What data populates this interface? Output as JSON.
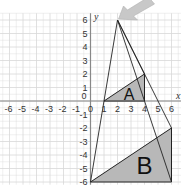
{
  "diagram": {
    "type": "coordinate-grid-enlargement",
    "axes": {
      "x_label": "x",
      "y_label": "y",
      "x_range": [
        -6,
        6
      ],
      "y_range": [
        -6,
        6
      ],
      "x_ticks": [
        "-6",
        "-5",
        "-4",
        "-3",
        "-2",
        "-1",
        "0",
        "1",
        "2",
        "3",
        "4",
        "5",
        "6"
      ],
      "y_ticks": [
        "6",
        "5",
        "4",
        "3",
        "2",
        "1",
        "0",
        "-1",
        "-2",
        "-3",
        "-4",
        "-5",
        "-6"
      ]
    },
    "shapes": [
      {
        "name": "A",
        "label": "A",
        "vertices": [
          [
            1,
            0
          ],
          [
            4,
            0
          ],
          [
            4,
            2
          ]
        ],
        "fill": "#b8b8b8"
      },
      {
        "name": "B",
        "label": "B",
        "vertices": [
          [
            0,
            -6
          ],
          [
            6,
            -6
          ],
          [
            6,
            -2
          ]
        ],
        "fill": "#b8b8b8"
      }
    ],
    "centre_of_enlargement": [
      2,
      6
    ],
    "construction_lines": [
      [
        [
          2,
          6
        ],
        [
          0,
          -6
        ]
      ],
      [
        [
          2,
          6
        ],
        [
          6,
          -6
        ]
      ],
      [
        [
          2,
          6
        ],
        [
          6,
          -2
        ]
      ]
    ],
    "pointer_arrow": {
      "points_to": [
        2,
        6
      ],
      "color": "#c8c8c8"
    },
    "colors": {
      "grid": "#d8d8d8",
      "axis": "#888888",
      "line": "#222222",
      "shape_fill": "#b8b8b8"
    }
  }
}
